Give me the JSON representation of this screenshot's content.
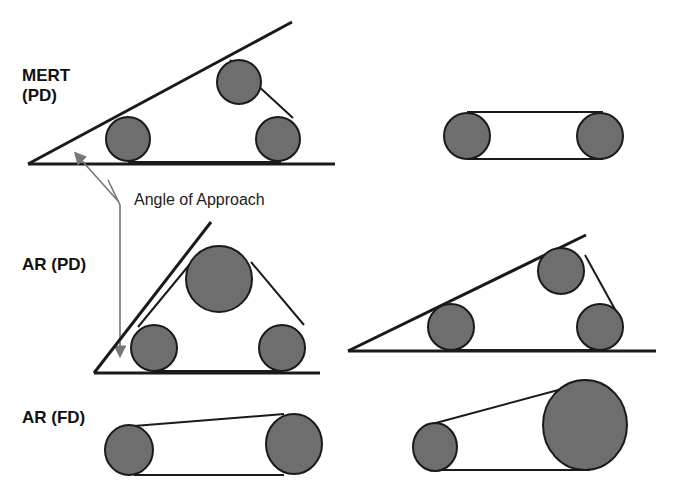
{
  "figure": {
    "labels": {
      "mert_pd_line1": "MERT",
      "mert_pd_line2": "(PD)",
      "ar_pd": "AR (PD)",
      "ar_fd": "AR (FD)",
      "angle_of_approach": "Angle of Approach"
    },
    "colors": {
      "roller_fill": "#6e6e6e",
      "line": "#1a1a1a",
      "arrow": "#777777",
      "background": "#ffffff"
    },
    "rows": [
      {
        "name": "MERT (PD)",
        "left": "three rollers in a wedge: two on the baseline and one elevated; an angled line from the baseline vertex touches the upper rollers",
        "right": "two equal rollers joined by a horizontal belt"
      },
      {
        "name": "AR (PD)",
        "left": "large top roller and two small bottom rollers forming a triangular belt, with a steep approach line",
        "right": "three rollers in a shallow wedge with an angled approach line"
      },
      {
        "name": "AR (FD)",
        "left": "two rollers with a slightly diverging belt",
        "right": "small roller and large roller joined by a tapered belt"
      }
    ]
  }
}
